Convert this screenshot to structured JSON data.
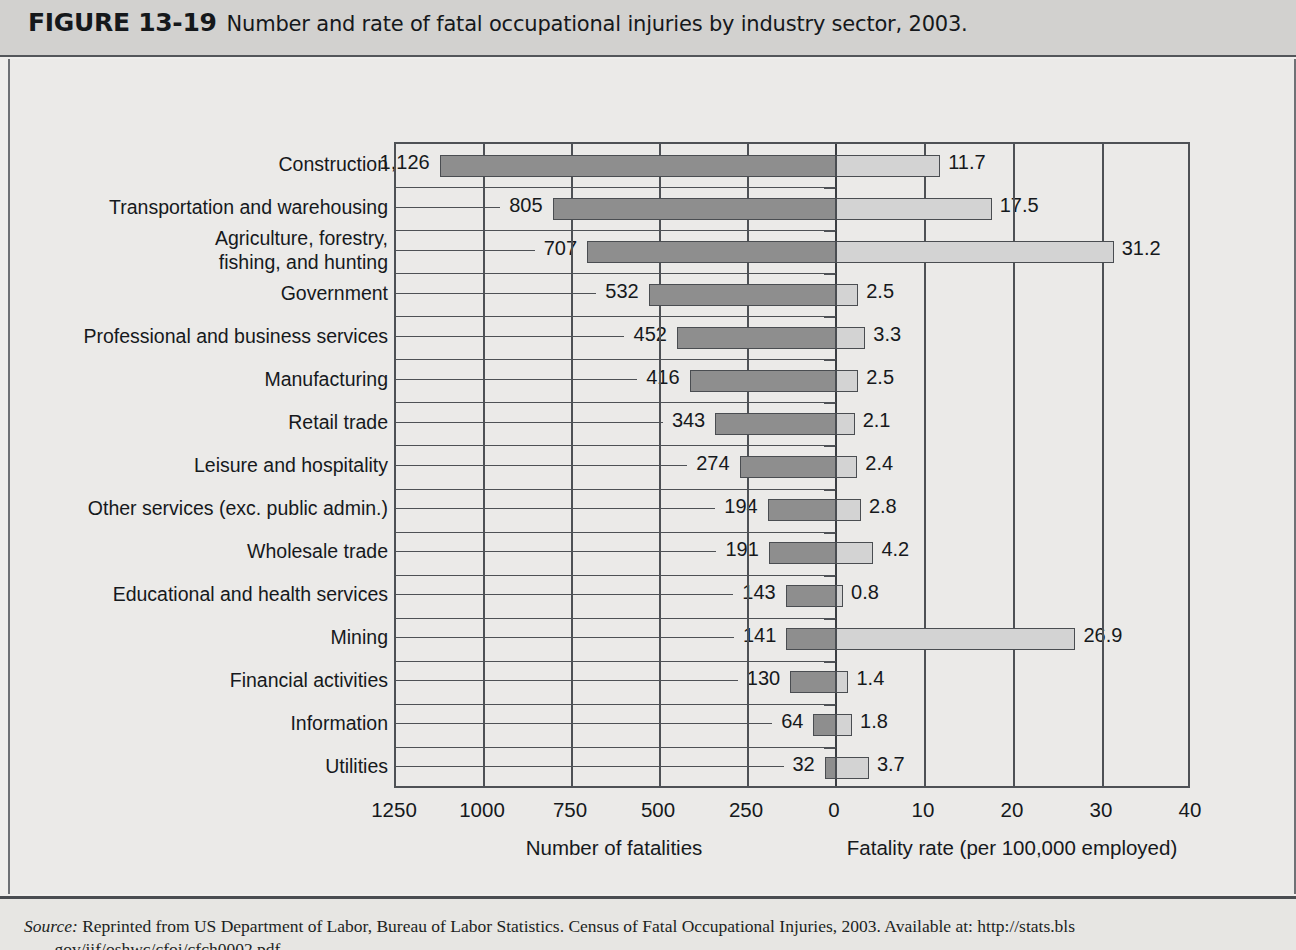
{
  "figure": {
    "number": "FIGURE 13-19",
    "caption": "Number and rate of fatal occupational injuries by industry sector, 2003."
  },
  "source": {
    "label": "Source:",
    "text": " Reprinted from US Department of Labor, Bureau of Labor Statistics. Census of Fatal Occupational Injuries, 2003. Available at: http://stats.bls",
    "line2": ".gov/iif/oshwc/cfoi/cfch0002.pdf"
  },
  "colors": {
    "fatalities_bar": "#8e8e8e",
    "rate_bar": "#d3d3d3",
    "axis": "#4e5155",
    "header_band": "#d2d1cf",
    "figure_background": "#ebeae8"
  },
  "chart_data": {
    "type": "bar",
    "orientation": "horizontal",
    "style": "bidirectional-pyramid",
    "title": "Number and rate of fatal occupational injuries by industry sector, 2003.",
    "categories": [
      "Construction",
      "Transportation and warehousing",
      "Agriculture, forestry,\nfishing, and hunting",
      "Government",
      "Professional and business services",
      "Manufacturing",
      "Retail trade",
      "Leisure and hospitality",
      "Other services (exc. public admin.)",
      "Wholesale trade",
      "Educational and health services",
      "Mining",
      "Financial activities",
      "Information",
      "Utilities"
    ],
    "series": [
      {
        "name": "Number of fatalities",
        "axis": "left",
        "direction": "left",
        "xlabel": "Number of fatalities",
        "xlim": [
          0,
          1250
        ],
        "ticks": [
          1250,
          1000,
          750,
          500,
          250,
          0
        ],
        "tick_labels": [
          "1250",
          "1000",
          "750",
          "500",
          "250",
          "0"
        ],
        "values": [
          1126,
          805,
          707,
          532,
          452,
          416,
          343,
          274,
          194,
          191,
          143,
          141,
          130,
          64,
          32
        ],
        "value_labels": [
          "1,126",
          "805",
          "707",
          "532",
          "452",
          "416",
          "343",
          "274",
          "194",
          "191",
          "143",
          "141",
          "130",
          "64",
          "32"
        ]
      },
      {
        "name": "Fatality rate (per 100,000 employed)",
        "axis": "right",
        "direction": "right",
        "xlabel": "Fatality rate (per 100,000 employed)",
        "xlim": [
          0,
          40
        ],
        "ticks": [
          0,
          10,
          20,
          30,
          40
        ],
        "tick_labels": [
          "0",
          "10",
          "20",
          "30",
          "40"
        ],
        "values": [
          11.7,
          17.5,
          31.2,
          2.5,
          3.3,
          2.5,
          2.1,
          2.4,
          2.8,
          4.2,
          0.8,
          26.9,
          1.4,
          1.8,
          3.7
        ],
        "value_labels": [
          "11.7",
          "17.5",
          "31.2",
          "2.5",
          "3.3",
          "2.5",
          "2.1",
          "2.4",
          "2.8",
          "4.2",
          "0.8",
          "26.9",
          "1.4",
          "1.8",
          "3.7"
        ]
      }
    ],
    "grid": true,
    "legend": "none"
  }
}
